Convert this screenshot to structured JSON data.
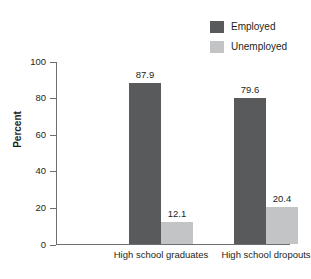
{
  "chart_data": {
    "type": "bar",
    "title": "",
    "xlabel": "",
    "ylabel": "Percent",
    "ylim": [
      0,
      100
    ],
    "yticks": [
      0,
      20,
      40,
      60,
      80,
      100
    ],
    "grid": false,
    "legend_position": "top-right",
    "categories": [
      "High school graduates",
      "High school dropouts"
    ],
    "series": [
      {
        "name": "Employed",
        "color": "#595a5c",
        "values": [
          87.9,
          79.6
        ],
        "labels": [
          "87.9",
          "79.6"
        ]
      },
      {
        "name": "Unemployed",
        "color": "#c3c4c6",
        "values": [
          12.1,
          20.4
        ],
        "labels": [
          "12.1",
          "20.4"
        ]
      }
    ]
  },
  "legend": {
    "items": [
      {
        "label": "Employed",
        "color": "#595a5c"
      },
      {
        "label": "Unemployed",
        "color": "#c3c4c6"
      }
    ]
  },
  "axes": {
    "y_title": "Percent",
    "y_tick_labels": [
      "100",
      "80",
      "60",
      "40",
      "20",
      "0"
    ],
    "x_tick_labels": [
      "High school graduates",
      "High school dropouts"
    ],
    "axis_color": "#6d6e71",
    "text_color": "#231f20"
  }
}
